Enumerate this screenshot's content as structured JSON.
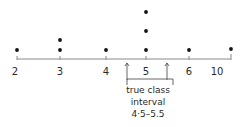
{
  "diagram": {
    "type": "dot-plot",
    "axis": {
      "ticks": [
        {
          "label": "2",
          "x": 17
        },
        {
          "label": "3",
          "x": 60
        },
        {
          "label": "4",
          "x": 106
        },
        {
          "label": "5",
          "x": 146
        },
        {
          "label": "6",
          "x": 189
        },
        {
          "label": "10",
          "x": 231
        }
      ]
    },
    "counts": {
      "2": 1,
      "3": 2,
      "4": 1,
      "5": 3,
      "6": 1,
      "10": 1
    },
    "annotation": {
      "line1": "true class",
      "line2": "interval",
      "line3": "4·5–5.5"
    },
    "colors": {
      "dot": "#111111",
      "axis": "#8a8a8a",
      "text": "#2a2a2a"
    }
  }
}
